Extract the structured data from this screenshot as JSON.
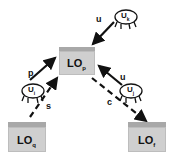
{
  "nodes": {
    "lo_center": {
      "name": "LO",
      "sub": "p"
    },
    "lo_left": {
      "name": "LO",
      "sub": "q"
    },
    "lo_right": {
      "name": "LO",
      "sub": "f"
    },
    "user_top": {
      "name": "U",
      "sub": "k"
    },
    "user_left": {
      "name": "U",
      "sub": "i"
    },
    "user_right": {
      "name": "U",
      "sub": "j"
    }
  },
  "edges": [
    {
      "from": "user_top",
      "to": "lo_center",
      "label": "u",
      "style": "solid"
    },
    {
      "from": "user_left",
      "to": "lo_center",
      "label": "p",
      "style": "solid"
    },
    {
      "from": "lo_left",
      "to": "lo_center",
      "label": "s",
      "style": "dashed"
    },
    {
      "from": "user_right",
      "to": "lo_center",
      "label": "u",
      "style": "solid"
    },
    {
      "from": "lo_center",
      "to": "lo_right",
      "label": "c",
      "style": "dashed"
    }
  ],
  "colors": {
    "box_front": "#cfcfcf",
    "box_top": "#a8a8a8",
    "arrow": "#111111"
  }
}
